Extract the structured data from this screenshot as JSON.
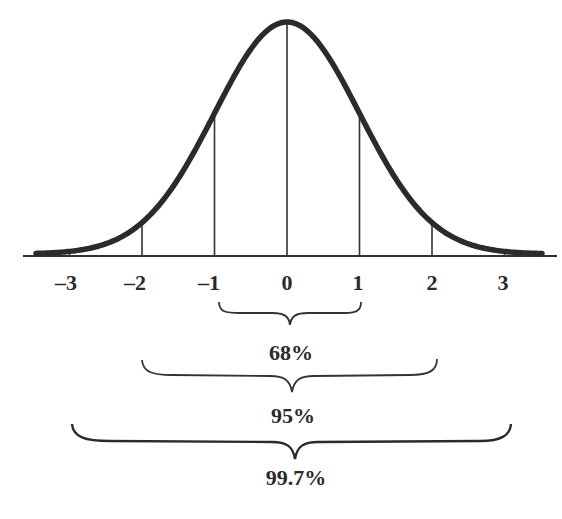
{
  "chart_data": {
    "type": "line",
    "title": "",
    "xlabel": "",
    "ylabel": "",
    "x_ticks": [
      -3,
      -2,
      -1,
      0,
      1,
      2,
      3
    ],
    "tick_labels": [
      "–3",
      "–2",
      "–1",
      "0",
      "1",
      "2",
      "3"
    ],
    "xlim": [
      -3.5,
      3.5
    ],
    "grid": false,
    "legend": null,
    "series": [
      {
        "name": "normal-density",
        "mean": 0,
        "sd": 1
      }
    ],
    "annotations": [
      {
        "range": [
          -1,
          1
        ],
        "label": "68%"
      },
      {
        "range": [
          -2,
          2
        ],
        "label": "95%"
      },
      {
        "range": [
          -3,
          3
        ],
        "label": "99.7%"
      }
    ],
    "colors": {
      "curve": "#2b2b2b",
      "lines": "#333333",
      "text": "#2a2a2a",
      "background": "#ffffff"
    }
  },
  "labels": {
    "ticks": [
      "–3",
      "–2",
      "–1",
      "0",
      "1",
      "2",
      "3"
    ],
    "pct68": "68%",
    "pct95": "95%",
    "pct997": "99.7%"
  }
}
